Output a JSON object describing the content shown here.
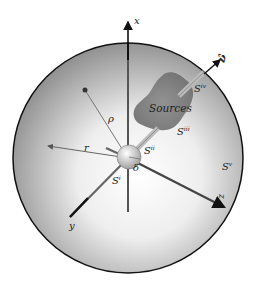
{
  "diagram": {
    "type": "physics-geometry",
    "colors": {
      "sphere_edge": "#111111",
      "sphere_center": "#ffffff",
      "sphere_rim": "#8a8a8a",
      "sources_fill": "#7d7d7d",
      "axis": "#333333",
      "thin_line": "#666666"
    },
    "axes": {
      "x": "x",
      "y": "y",
      "z": "z"
    },
    "labels": {
      "nu": "ν̂",
      "sources": "Sources",
      "rho": "ρ",
      "r": "r",
      "delta": "δ",
      "S_i": "S",
      "S_i_sup": "i",
      "S_ii": "S",
      "S_ii_sup": "ii",
      "S_iii": "S",
      "S_iii_sup": "iii",
      "S_iv": "S",
      "S_iv_sup": "iv",
      "S_v": "S",
      "S_v_sup": "v"
    }
  }
}
